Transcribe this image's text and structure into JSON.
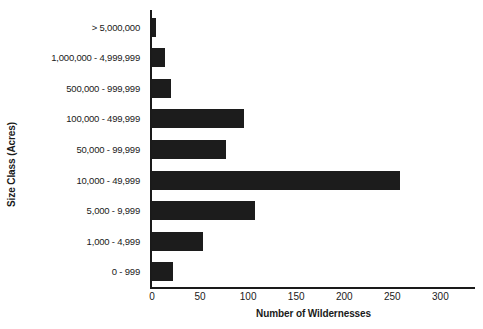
{
  "chart_data": {
    "type": "bar",
    "orientation": "horizontal",
    "title": "",
    "xlabel": "Number of Wildernesses",
    "ylabel": "Size Class (Acres)",
    "categories": [
      "> 5,000,000",
      "1,000,000 - 4,999,999",
      "500,000 - 999,999",
      "100,000 - 499,999",
      "50,000 - 99,999",
      "10,000 - 49,999",
      "5,000 - 9,999",
      "1,000 - 4,999",
      "0 - 999"
    ],
    "values": [
      4,
      14,
      20,
      96,
      77,
      258,
      107,
      53,
      22
    ],
    "xticks": [
      0,
      50,
      100,
      150,
      200,
      250,
      300
    ],
    "xtick_labels": [
      "0",
      "50",
      "100",
      "150",
      "200",
      "250",
      "300"
    ],
    "xlim": [
      0,
      336
    ],
    "grid": false,
    "legend": false,
    "bar_color": "#1c1c1c",
    "axis_color": "#1a1a1a",
    "background": "#ffffff"
  }
}
